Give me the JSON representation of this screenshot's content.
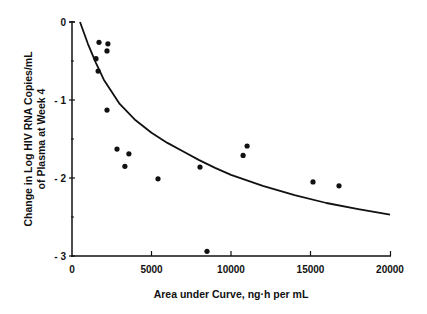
{
  "chart_data": {
    "type": "scatter",
    "title": "",
    "xlabel": "Area under Curve, ng·h per mL",
    "ylabel_lines": [
      "Change in Log HIV RNA Copies/mL",
      "of Plasma at Week 4"
    ],
    "xlim": [
      0,
      20000
    ],
    "ylim": [
      -3,
      0
    ],
    "x_ticks": [
      0,
      5000,
      10000,
      15000,
      20000
    ],
    "x_tick_labels": [
      "0",
      "5000",
      "10000",
      "15000",
      "20000"
    ],
    "y_ticks": [
      0,
      -1,
      -2,
      -3
    ],
    "y_tick_labels": [
      "0",
      "- 1",
      "- 2",
      "- 3"
    ],
    "grid": false,
    "legend": null,
    "series": [
      {
        "name": "Patients",
        "marker": "dot",
        "points": [
          {
            "x": 1700,
            "y": -0.26
          },
          {
            "x": 2260,
            "y": -0.28
          },
          {
            "x": 2200,
            "y": -0.37
          },
          {
            "x": 1510,
            "y": -0.47
          },
          {
            "x": 1640,
            "y": -0.63
          },
          {
            "x": 2200,
            "y": -1.13
          },
          {
            "x": 2830,
            "y": -1.63
          },
          {
            "x": 3580,
            "y": -1.69
          },
          {
            "x": 3330,
            "y": -1.85
          },
          {
            "x": 5410,
            "y": -2.01
          },
          {
            "x": 8050,
            "y": -1.86
          },
          {
            "x": 8490,
            "y": -2.94
          },
          {
            "x": 10760,
            "y": -1.71
          },
          {
            "x": 11010,
            "y": -1.59
          },
          {
            "x": 15160,
            "y": -2.05
          },
          {
            "x": 16790,
            "y": -2.1
          }
        ]
      },
      {
        "name": "Fitted curve",
        "type": "line",
        "points": [
          {
            "x": 500,
            "y": 0.0
          },
          {
            "x": 1000,
            "y": -0.28
          },
          {
            "x": 1500,
            "y": -0.52
          },
          {
            "x": 2000,
            "y": -0.74
          },
          {
            "x": 3000,
            "y": -1.05
          },
          {
            "x": 4000,
            "y": -1.26
          },
          {
            "x": 5000,
            "y": -1.42
          },
          {
            "x": 6000,
            "y": -1.55
          },
          {
            "x": 7000,
            "y": -1.66
          },
          {
            "x": 8000,
            "y": -1.77
          },
          {
            "x": 9000,
            "y": -1.87
          },
          {
            "x": 10000,
            "y": -1.96
          },
          {
            "x": 12000,
            "y": -2.1
          },
          {
            "x": 14000,
            "y": -2.22
          },
          {
            "x": 16000,
            "y": -2.32
          },
          {
            "x": 18000,
            "y": -2.4
          },
          {
            "x": 20000,
            "y": -2.47
          }
        ]
      }
    ]
  }
}
